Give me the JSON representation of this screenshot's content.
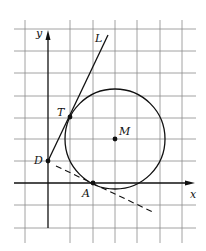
{
  "diagram": {
    "type": "coordinate-geometry",
    "grid": {
      "origin_px": [
        48,
        183
      ],
      "unit_px": 22.4,
      "x_range": [
        -1,
        6
      ],
      "y_range": [
        -2.7,
        7
      ]
    },
    "axes": {
      "x_label": "x",
      "y_label": "y"
    },
    "points": [
      {
        "label": "D",
        "x": 0,
        "y": 1
      },
      {
        "label": "T",
        "x": 1,
        "y": 3
      },
      {
        "label": "M",
        "x": 3,
        "y": 2
      },
      {
        "label": "A",
        "x": 2,
        "y": 0
      }
    ],
    "circle": {
      "center": "M",
      "cx": 3,
      "cy": 2,
      "r": 2.236
    },
    "line_L": {
      "label": "L",
      "from": [
        0,
        1
      ],
      "to": [
        2.7,
        6.4
      ],
      "style": "solid"
    },
    "tangent_at_A": {
      "from": [
        0.5,
        0.75
      ],
      "to": [
        4.8,
        -1.35
      ],
      "style": "dashed"
    },
    "colors": {
      "ink": "#111111",
      "grid": "#8a8a8a",
      "background": "#ffffff"
    }
  }
}
